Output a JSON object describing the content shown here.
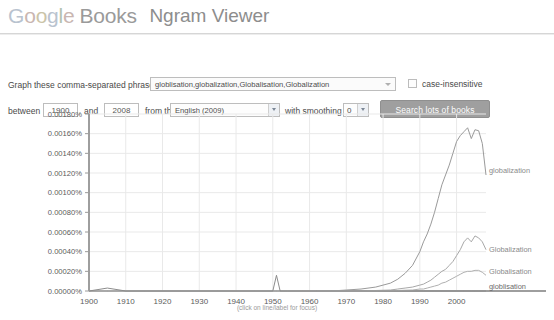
{
  "header": {
    "logo_google": "Google",
    "logo_books": "Books",
    "product": "Ngram Viewer"
  },
  "form": {
    "phrases_label": "Graph these comma-separated phrases:",
    "phrases_value": "globlisation,globalization,Globalisation,Globalization",
    "phrases_placeholder": "Enter comma-separated phrases",
    "case_insensitive_label": "case-insensitive",
    "case_insensitive_checked": false,
    "between_label": "between",
    "year_start": "1900",
    "and_label": "and",
    "year_end": "2008",
    "corpus_label": "from the corpus",
    "corpus_value": "English (2009)",
    "smoothing_label": "with smoothing of",
    "smoothing_value": "0",
    "search_button": "Search lots of books"
  },
  "chart_data": {
    "type": "line",
    "title": "",
    "xlabel": "",
    "ylabel": "",
    "xlim": [
      1900,
      2008
    ],
    "ylim": [
      0.0,
      0.0018
    ],
    "grid": true,
    "legend": "right-inline-labels",
    "caption": "(click on line/label for focus)",
    "ytick_labels": [
      "0.00180%",
      "0.00160%",
      "0.00140%",
      "0.00120%",
      "0.00100%",
      "0.00080%",
      "0.00060%",
      "0.00040%",
      "0.00020%",
      "0.00000%"
    ],
    "ytick_values": [
      0.0018,
      0.0016,
      0.0014,
      0.0012,
      0.001,
      0.0008,
      0.0006,
      0.0004,
      0.0002,
      0.0
    ],
    "xtick_labels": [
      "1900",
      "1910",
      "1920",
      "1930",
      "1940",
      "1950",
      "1960",
      "1970",
      "1980",
      "1990",
      "2000"
    ],
    "xtick_values": [
      1900,
      1910,
      1920,
      1930,
      1940,
      1950,
      1960,
      1970,
      1980,
      1990,
      2000
    ],
    "x": [
      1900,
      1905,
      1910,
      1915,
      1920,
      1925,
      1930,
      1935,
      1940,
      1945,
      1948,
      1950,
      1951,
      1952,
      1954,
      1958,
      1962,
      1966,
      1970,
      1974,
      1978,
      1982,
      1984,
      1986,
      1988,
      1990,
      1991,
      1992,
      1993,
      1994,
      1995,
      1996,
      1997,
      1998,
      1999,
      2000,
      2001,
      2002,
      2003,
      2004,
      2005,
      2006,
      2007,
      2008
    ],
    "series": [
      {
        "name": "globalization",
        "color": "#9a9a9a",
        "label": "globalization",
        "values": [
          0,
          0,
          0,
          0,
          0,
          0,
          0,
          0,
          0,
          0,
          0,
          0,
          0,
          0,
          0,
          0,
          0,
          0,
          1e-05,
          2e-05,
          4e-05,
          8e-05,
          0.00012,
          0.00018,
          0.00026,
          0.0004,
          0.0005,
          0.00058,
          0.00068,
          0.0008,
          0.00094,
          0.00108,
          0.00118,
          0.00128,
          0.0014,
          0.00152,
          0.00158,
          0.00162,
          0.00166,
          0.00155,
          0.00164,
          0.00163,
          0.0015,
          0.00118
        ]
      },
      {
        "name": "Globalization",
        "color": "#a8a8a8",
        "label": "Globalization",
        "values": [
          0,
          0,
          0,
          0,
          0,
          0,
          0,
          0,
          0,
          0,
          0,
          0,
          0,
          0,
          0,
          0,
          0,
          0,
          0,
          0,
          5e-06,
          1e-05,
          2e-05,
          3e-05,
          4e-05,
          6e-05,
          7e-05,
          9e-05,
          0.00011,
          0.00014,
          0.00017,
          0.0002,
          0.00022,
          0.00026,
          0.0003,
          0.00036,
          0.00042,
          0.0005,
          0.00054,
          0.0005,
          0.00056,
          0.00054,
          0.0005,
          0.00042
        ]
      },
      {
        "name": "Globalisation",
        "color": "#b0b0b0",
        "label": "Globalisation",
        "values": [
          0,
          0,
          0,
          0,
          0,
          0,
          0,
          0,
          0,
          0,
          0,
          0,
          0,
          0,
          0,
          0,
          0,
          0,
          0,
          0,
          0,
          3e-06,
          5e-06,
          8e-06,
          1e-05,
          2e-05,
          2e-05,
          3e-05,
          4e-05,
          5e-05,
          6e-05,
          8e-05,
          9e-05,
          0.00011,
          0.00013,
          0.00015,
          0.00017,
          0.00019,
          0.0002,
          0.0002,
          0.00021,
          0.00021,
          0.00019,
          0.00016
        ]
      },
      {
        "name": "globlisation",
        "color": "#8c8c8c",
        "label": "globlisation",
        "values": [
          0,
          3e-05,
          0,
          0,
          0,
          0,
          0,
          0,
          0,
          0,
          0,
          0,
          0.00016,
          0,
          0,
          0,
          0,
          0,
          0,
          0,
          0,
          0,
          0,
          0,
          0,
          0,
          0,
          0,
          0,
          0,
          0,
          0,
          0,
          0,
          0,
          0,
          0,
          0,
          0,
          0,
          0,
          0,
          0,
          0
        ]
      }
    ]
  }
}
